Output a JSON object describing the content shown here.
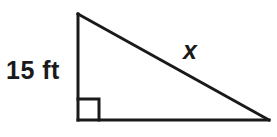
{
  "figure": {
    "name": "right-triangle-figure",
    "background_color": "#ffffff",
    "stroke_color": "#1a1a1a",
    "text_color": "#1a1a1a",
    "stroke_width": 3,
    "width": 277,
    "height": 137
  },
  "labels": {
    "vertical_leg": "15 ft",
    "hypotenuse": "x"
  },
  "geometry": {
    "apex": {
      "x": 78,
      "y": 14
    },
    "right_angle_vertex": {
      "x": 78,
      "y": 120
    },
    "base_right_vertex": {
      "x": 269,
      "y": 120
    },
    "right_angle_marker_size": 21,
    "vertical_leg_path": "M 78 14 L 78 120",
    "base_path": "M 78 120 L 269 120",
    "hypotenuse_path": "M 78 14 L 269 120",
    "right_angle_marker_path": "M 78 99 L 99 99 L 99 120"
  },
  "chart_data": {
    "type": "diagram",
    "title": "",
    "shape": "right triangle",
    "annotations": [
      {
        "name": "vertical-leg",
        "text": "15 ft",
        "side": "left leg",
        "value": 15,
        "unit": "ft"
      },
      {
        "name": "hypotenuse",
        "text": "x",
        "side": "hypotenuse",
        "value": null,
        "unit": null
      }
    ],
    "right_angle_at": "bottom-left"
  }
}
